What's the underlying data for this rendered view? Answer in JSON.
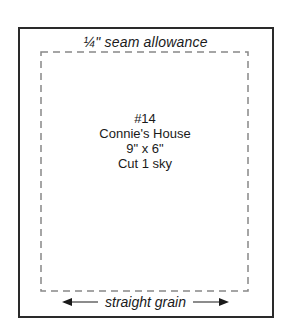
{
  "pattern": {
    "seam_label": "¼\" seam allowance",
    "piece_number": "#14",
    "block_name": "Connie's House",
    "size": "9\" x 6\"",
    "cut_instruction": "Cut 1 sky",
    "grain_label": "straight grain"
  },
  "colors": {
    "line": "#2a2a2a",
    "dashed": "#888888",
    "background": "#ffffff"
  }
}
